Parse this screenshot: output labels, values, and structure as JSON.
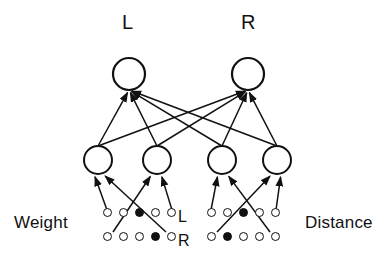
{
  "diagram": {
    "background_color": "#ffffff",
    "stroke_color": "#111111",
    "node_fill_color": "#ffffff"
  },
  "output_layer": {
    "nodes": [
      {
        "id": "out-L",
        "label": "L",
        "cx": 129,
        "cy": 74,
        "r": 16
      },
      {
        "id": "out-R",
        "label": "R",
        "cx": 248,
        "cy": 74,
        "r": 16
      }
    ],
    "label_y": 22
  },
  "hidden_layer": {
    "nodes": [
      {
        "id": "hid-1",
        "cx": 98,
        "cy": 160,
        "r": 14
      },
      {
        "id": "hid-2",
        "cx": 157,
        "cy": 160,
        "r": 14
      },
      {
        "id": "hid-3",
        "cx": 222,
        "cy": 160,
        "r": 14
      },
      {
        "id": "hid-4",
        "cx": 277,
        "cy": 160,
        "r": 14
      }
    ]
  },
  "input_groups": [
    {
      "id": "weight-group",
      "side_label": "Weight",
      "side_label_x": 14,
      "side_label_y": 214,
      "row_label_x": 178,
      "rows": [
        {
          "row_label": "L",
          "y": 212,
          "x": 103,
          "units": [
            "open",
            "open",
            "filled",
            "open",
            "open"
          ],
          "active_index": 2
        },
        {
          "row_label": "R",
          "y": 236,
          "x": 103,
          "units": [
            "open",
            "open",
            "open",
            "filled",
            "open"
          ],
          "active_index": 3
        }
      ]
    },
    {
      "id": "distance-group",
      "side_label": "Distance",
      "side_label_x": 305,
      "side_label_y": 214,
      "row_label_x": 178,
      "rows": [
        {
          "row_label": "L",
          "y": 212,
          "x": 207,
          "units": [
            "open",
            "open",
            "filled",
            "open",
            "open"
          ],
          "active_index": 2
        },
        {
          "row_label": "R",
          "y": 236,
          "x": 207,
          "units": [
            "open",
            "filled",
            "open",
            "open",
            "open"
          ],
          "active_index": 1
        }
      ]
    }
  ],
  "connections": {
    "hidden_to_output": [
      {
        "from": "hid-1",
        "to": "out-L"
      },
      {
        "from": "hid-1",
        "to": "out-R"
      },
      {
        "from": "hid-2",
        "to": "out-L"
      },
      {
        "from": "hid-2",
        "to": "out-R"
      },
      {
        "from": "hid-3",
        "to": "out-L"
      },
      {
        "from": "hid-3",
        "to": "out-R"
      },
      {
        "from": "hid-4",
        "to": "out-L"
      },
      {
        "from": "hid-4",
        "to": "out-R"
      }
    ],
    "input_to_hidden": [
      {
        "from": "weight-L",
        "to": "hid-1"
      },
      {
        "from": "weight-R",
        "to": "hid-1"
      },
      {
        "from": "weight-L",
        "to": "hid-2"
      },
      {
        "from": "weight-R",
        "to": "hid-2"
      },
      {
        "from": "distance-L",
        "to": "hid-3"
      },
      {
        "from": "distance-R",
        "to": "hid-3"
      },
      {
        "from": "distance-L",
        "to": "hid-4"
      },
      {
        "from": "distance-R",
        "to": "hid-4"
      }
    ]
  }
}
